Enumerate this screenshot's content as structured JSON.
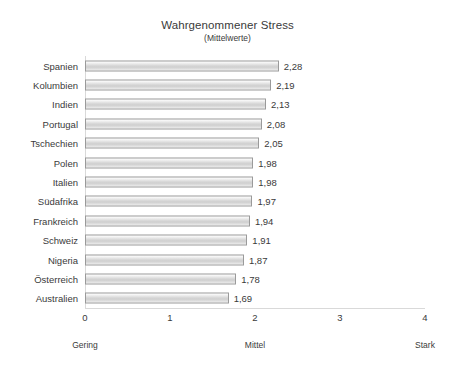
{
  "chart_data": {
    "type": "bar",
    "orientation": "horizontal",
    "title": "Wahrgenommener Stress",
    "subtitle": "(Mittelwerte)",
    "xlabel": "",
    "ylabel": "",
    "xlim": [
      0,
      4
    ],
    "grid": false,
    "legend": null,
    "categories": [
      "Spanien",
      "Kolumbien",
      "Indien",
      "Portugal",
      "Tschechien",
      "Polen",
      "Italien",
      "Südafrika",
      "Frankreich",
      "Schweiz",
      "Nigeria",
      "Österreich",
      "Australien"
    ],
    "values": [
      2.28,
      2.19,
      2.13,
      2.08,
      2.05,
      1.98,
      1.98,
      1.97,
      1.94,
      1.91,
      1.87,
      1.78,
      1.69
    ],
    "value_labels": [
      "2,28",
      "2,19",
      "2,13",
      "2,08",
      "2,05",
      "1,98",
      "1,98",
      "1,97",
      "1,94",
      "1,91",
      "1,87",
      "1,78",
      "1,69"
    ],
    "xticks": [
      0,
      1,
      2,
      3,
      4
    ],
    "xtick_labels": [
      "0",
      "1",
      "2",
      "3",
      "4"
    ],
    "scale_anchors": [
      {
        "label": "Gering",
        "value": 0
      },
      {
        "label": "Mittel",
        "value": 2
      },
      {
        "label": "Stark",
        "value": 4
      }
    ],
    "colors": {
      "bar_fill": "#d6d6d6",
      "bar_border": "#9a9a9a",
      "text": "#3a3a3a",
      "axis": "#d9d9d9",
      "background": "#ffffff"
    }
  }
}
